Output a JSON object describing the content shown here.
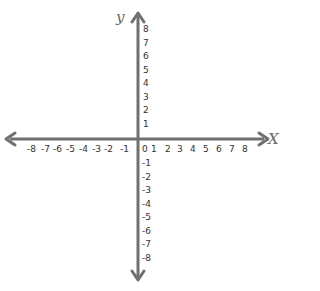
{
  "diagram": {
    "type": "coordinate-plane",
    "axis_color": "#707070",
    "label_color": "#333333",
    "x_axis": {
      "name": "X",
      "ticks": [
        "-8",
        "-7",
        "-6",
        "-5",
        "-4",
        "-3",
        "-2",
        "-1",
        "0",
        "1",
        "2",
        "3",
        "4",
        "5",
        "6",
        "7",
        "8"
      ]
    },
    "y_axis": {
      "name": "y",
      "positive_ticks": [
        "8",
        "7",
        "6",
        "5",
        "4",
        "3",
        "2",
        "1"
      ],
      "negative_ticks": [
        "-1",
        "-2",
        "-3",
        "-4",
        "-5",
        "-6",
        "-7",
        "-8"
      ]
    }
  }
}
